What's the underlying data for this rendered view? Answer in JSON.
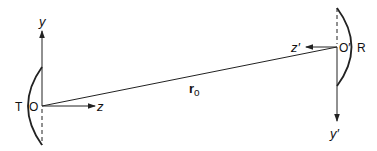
{
  "diagram": {
    "transmitter": {
      "label": "T",
      "origin_label": "O",
      "y_axis_label": "y",
      "z_axis_label": "z"
    },
    "receiver": {
      "label": "R",
      "origin_label": "O′",
      "y_axis_label": "y′",
      "z_axis_label": "z′"
    },
    "separation_vector": {
      "label": "r",
      "subscript": "o"
    },
    "colors": {
      "line": "#222222",
      "background": "#ffffff"
    }
  }
}
